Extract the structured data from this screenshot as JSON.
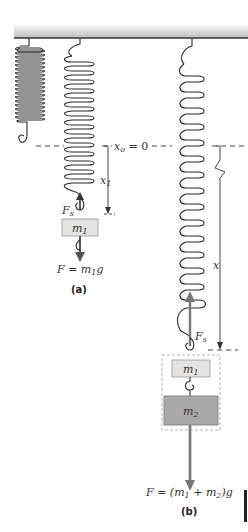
{
  "diagram": {
    "colors": {
      "ceiling_top": "#ffffff",
      "ceiling_bottom": "#bdbdbd",
      "ceiling_edge": "#333333",
      "spring": "#2a2a2a",
      "mass1_fill": "#e3e3e3",
      "mass2_fill": "#a9a9a9",
      "arrow": "#777777",
      "dashed_box": "#aaaaaa"
    },
    "reference_line": {
      "label_var": "x",
      "label_sub": "o",
      "label_rest": " = 0"
    },
    "panel_a": {
      "caption": "(a)",
      "displacement_var": "x",
      "displacement_sub": "1",
      "spring_force_var": "F",
      "spring_force_sub": "s",
      "mass_var": "m",
      "mass_sub": "1",
      "weight_label": "F = m",
      "weight_sub": "1",
      "weight_tail": "g"
    },
    "panel_b": {
      "caption": "(b)",
      "displacement_var": "x",
      "spring_force_var": "F",
      "spring_force_sub": "s",
      "mass1_var": "m",
      "mass1_sub": "1",
      "mass2_var": "m",
      "mass2_sub": "2",
      "weight_label_1": "F = (m",
      "weight_sub_1": "1",
      "weight_label_2": " + m",
      "weight_sub_2": "2",
      "weight_tail": ")g"
    }
  }
}
